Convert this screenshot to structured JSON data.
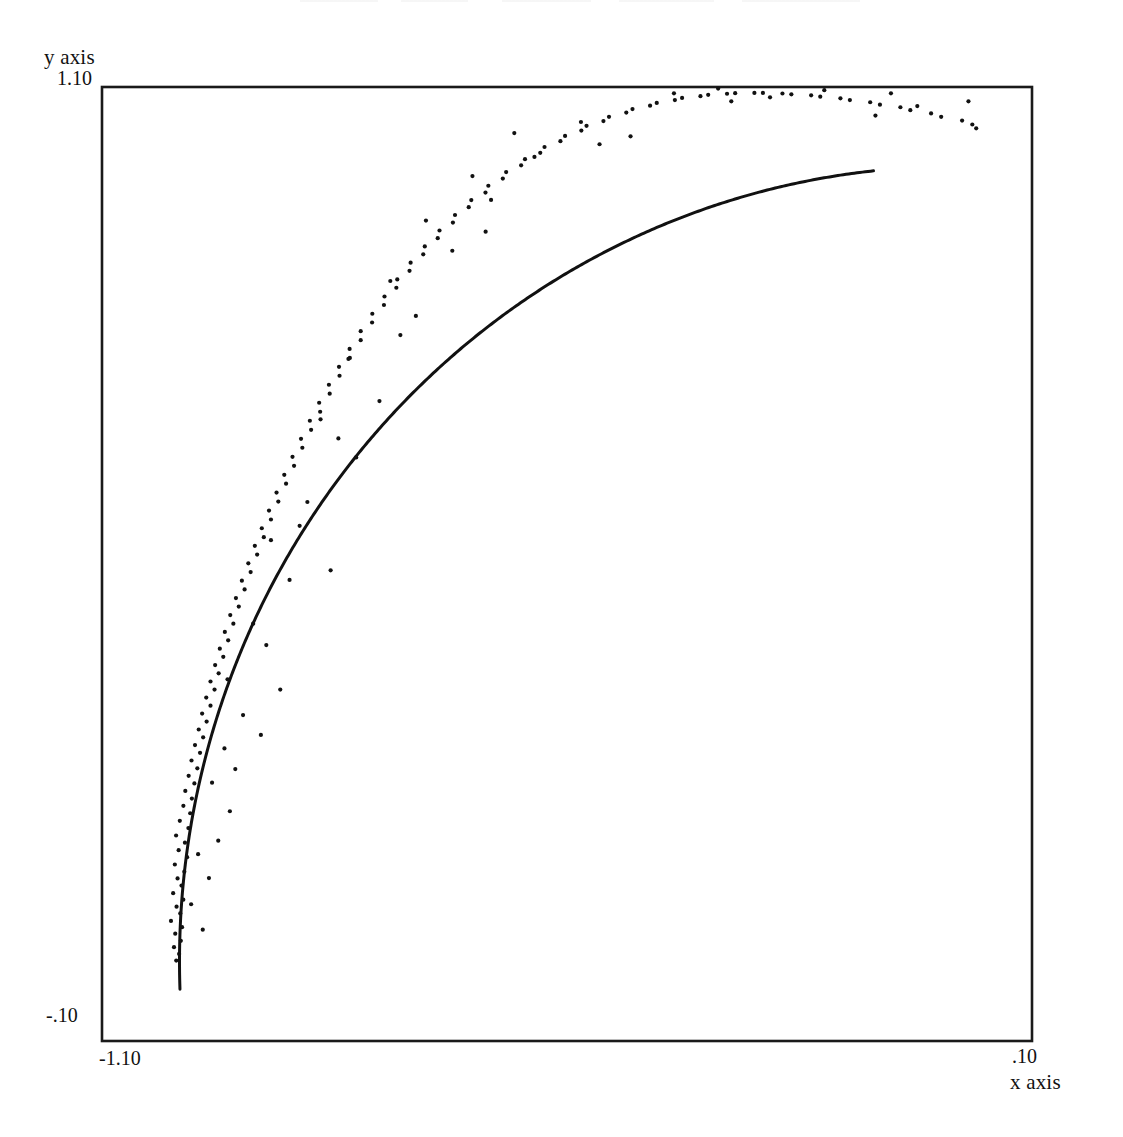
{
  "figure": {
    "background_color": "#ffffff",
    "ink_color": "#111111",
    "width": 1123,
    "height": 1137
  },
  "axes": {
    "y_axis_name": "y axis",
    "x_axis_name": "x axis",
    "y_tick_max": "1.10",
    "y_tick_min": "-.10",
    "x_tick_min": "-1.10",
    "x_tick_max": ".10",
    "frame": {
      "left": 102,
      "top": 87,
      "right": 1032,
      "bottom": 1041
    }
  },
  "chart_data": {
    "type": "scatter",
    "title": "",
    "xlabel": "x axis",
    "ylabel": "y axis",
    "xlim": [
      -1.1,
      0.1
    ],
    "ylim": [
      -0.1,
      1.1
    ],
    "xticks": [
      -1.1,
      0.1
    ],
    "xticklabels": [
      "-1.10",
      ".10"
    ],
    "yticks": [
      -0.1,
      1.1
    ],
    "yticklabels": [
      "-.10",
      "1.10"
    ],
    "grid": false,
    "legend": null,
    "series": [
      {
        "name": "fitted arc",
        "type": "line",
        "description": "unit circle arc, centre (0,0), radius 1.0, second quadrant from (-1,0) to (0,1)",
        "circle_center": [
          0.0,
          0.0
        ],
        "circle_radius": 1.0,
        "theta_deg_range": [
          96,
          182
        ],
        "color": "#111111",
        "linewidth": 3.0
      },
      {
        "name": "observations",
        "type": "scatter",
        "marker": "point",
        "marker_size": 3,
        "color": "#111111",
        "description": "noisy samples scattered about the unit circle arc",
        "points": [
          [
            -1.0042,
            0.0012
          ],
          [
            -1.0005,
            0.0095
          ],
          [
            -1.0071,
            0.018
          ],
          [
            -0.9983,
            0.026
          ],
          [
            -1.0055,
            0.035
          ],
          [
            -0.9967,
            0.0432
          ],
          [
            -1.011,
            0.051
          ],
          [
            -0.999,
            0.0605
          ],
          [
            -1.0038,
            0.069
          ],
          [
            -0.9951,
            0.0778
          ],
          [
            -1.0082,
            0.086
          ],
          [
            -0.9974,
            0.0955
          ],
          [
            -1.0025,
            0.1045
          ],
          [
            -0.9938,
            0.113
          ],
          [
            -1.006,
            0.122
          ],
          [
            -0.9902,
            0.1312
          ],
          [
            -1.0011,
            0.14
          ],
          [
            -0.993,
            0.1495
          ],
          [
            -1.0044,
            0.1585
          ],
          [
            -0.9885,
            0.1678
          ],
          [
            -0.9996,
            0.177
          ],
          [
            -0.9862,
            0.1865
          ],
          [
            -0.995,
            0.1958
          ],
          [
            -0.984,
            0.205
          ],
          [
            -0.9925,
            0.2145
          ],
          [
            -0.9808,
            0.224
          ],
          [
            -0.9882,
            0.2335
          ],
          [
            -0.977,
            0.243
          ],
          [
            -0.9845,
            0.2528
          ],
          [
            -0.9735,
            0.2625
          ],
          [
            -0.98,
            0.2722
          ],
          [
            -0.9695,
            0.282
          ],
          [
            -0.9752,
            0.2918
          ],
          [
            -0.965,
            0.3018
          ],
          [
            -0.9708,
            0.3118
          ],
          [
            -0.96,
            0.3218
          ],
          [
            -0.9655,
            0.332
          ],
          [
            -0.9548,
            0.342
          ],
          [
            -0.96,
            0.3522
          ],
          [
            -0.9495,
            0.3625
          ],
          [
            -0.954,
            0.3728
          ],
          [
            -0.9435,
            0.3832
          ],
          [
            -0.948,
            0.3935
          ],
          [
            -0.9372,
            0.404
          ],
          [
            -0.9415,
            0.4145
          ],
          [
            -0.9305,
            0.425
          ],
          [
            -0.9345,
            0.4358
          ],
          [
            -0.9235,
            0.4465
          ],
          [
            -0.9272,
            0.4572
          ],
          [
            -0.916,
            0.468
          ],
          [
            -0.9195,
            0.479
          ],
          [
            -0.9082,
            0.4898
          ],
          [
            -0.9112,
            0.5008
          ],
          [
            -0.8998,
            0.5118
          ],
          [
            -0.9028,
            0.5228
          ],
          [
            -0.8912,
            0.5338
          ],
          [
            -0.8938,
            0.545
          ],
          [
            -0.882,
            0.556
          ],
          [
            -0.8845,
            0.5672
          ],
          [
            -0.8725,
            0.5785
          ],
          [
            -0.8748,
            0.5898
          ],
          [
            -0.8625,
            0.601
          ],
          [
            -0.8648,
            0.6122
          ],
          [
            -0.8522,
            0.6235
          ],
          [
            -0.8542,
            0.6348
          ],
          [
            -0.8415,
            0.6462
          ],
          [
            -0.8432,
            0.6575
          ],
          [
            -0.8302,
            0.6688
          ],
          [
            -0.8318,
            0.6802
          ],
          [
            -0.8185,
            0.6915
          ],
          [
            -0.8198,
            0.7028
          ],
          [
            -0.8062,
            0.7142
          ],
          [
            -0.8072,
            0.7255
          ],
          [
            -0.7935,
            0.7368
          ],
          [
            -0.7942,
            0.748
          ],
          [
            -0.7802,
            0.7592
          ],
          [
            -0.7805,
            0.7705
          ],
          [
            -0.7662,
            0.7815
          ],
          [
            -0.7662,
            0.7928
          ],
          [
            -0.7515,
            0.8038
          ],
          [
            -0.7512,
            0.8148
          ],
          [
            -0.7362,
            0.8258
          ],
          [
            -0.7355,
            0.8365
          ],
          [
            -0.7202,
            0.8475
          ],
          [
            -0.719,
            0.858
          ],
          [
            -0.7032,
            0.8688
          ],
          [
            -0.7018,
            0.879
          ],
          [
            -0.6855,
            0.8895
          ],
          [
            -0.6835,
            0.8995
          ],
          [
            -0.6668,
            0.9098
          ],
          [
            -0.6645,
            0.9195
          ],
          [
            -0.6472,
            0.9295
          ],
          [
            -0.6445,
            0.939
          ],
          [
            -0.6268,
            0.9488
          ],
          [
            -0.6235,
            0.9578
          ],
          [
            -0.6052,
            0.9672
          ],
          [
            -0.6015,
            0.9758
          ],
          [
            -0.5828,
            0.9848
          ],
          [
            -0.5785,
            0.993
          ],
          [
            -0.5592,
            1.0015
          ],
          [
            -0.5542,
            1.0092
          ],
          [
            -0.5345,
            1.0172
          ],
          [
            -0.529,
            1.0245
          ],
          [
            -0.5085,
            1.0318
          ],
          [
            -0.5025,
            1.0385
          ],
          [
            -0.4815,
            1.0452
          ],
          [
            -0.4748,
            1.0512
          ],
          [
            -0.453,
            1.0572
          ],
          [
            -0.4458,
            1.0625
          ],
          [
            -0.4235,
            1.0678
          ],
          [
            -0.4155,
            1.0722
          ],
          [
            -0.3928,
            1.0765
          ],
          [
            -0.3842,
            1.08
          ],
          [
            -0.3608,
            1.0835
          ],
          [
            -0.3515,
            1.0862
          ],
          [
            -0.3278,
            1.0885
          ],
          [
            -0.3178,
            1.0902
          ],
          [
            -0.2935,
            1.0915
          ],
          [
            -0.283,
            1.0922
          ],
          [
            -0.2582,
            1.0925
          ],
          [
            -0.2472,
            1.0925
          ],
          [
            -0.222,
            1.0918
          ],
          [
            -0.2105,
            1.0908
          ],
          [
            -0.185,
            1.0895
          ],
          [
            -0.1732,
            1.0878
          ],
          [
            -0.1472,
            1.0858
          ],
          [
            -0.135,
            1.0835
          ],
          [
            -0.1088,
            1.0808
          ],
          [
            -0.0962,
            1.0778
          ],
          [
            -0.0698,
            1.0745
          ],
          [
            -0.057,
            1.0708
          ],
          [
            -0.0302,
            1.0668
          ],
          [
            -0.0172,
            1.0625
          ],
          [
            0.0098,
            1.0578
          ],
          [
            0.023,
            1.0528
          ],
          [
            -0.97,
            0.04
          ],
          [
            -0.962,
            0.105
          ],
          [
            -0.95,
            0.152
          ],
          [
            -0.935,
            0.189
          ],
          [
            -0.958,
            0.225
          ],
          [
            -0.942,
            0.268
          ],
          [
            -0.918,
            0.31
          ],
          [
            -0.938,
            0.355
          ],
          [
            -0.895,
            0.285
          ],
          [
            -0.87,
            0.342
          ],
          [
            -0.905,
            0.425
          ],
          [
            -0.858,
            0.48
          ],
          [
            -0.882,
            0.53
          ],
          [
            -0.835,
            0.578
          ],
          [
            -0.805,
            0.492
          ],
          [
            -0.772,
            0.634
          ],
          [
            -0.818,
            0.682
          ],
          [
            -0.742,
            0.705
          ],
          [
            -0.782,
            0.758
          ],
          [
            -0.695,
            0.812
          ],
          [
            -0.728,
            0.856
          ],
          [
            -0.648,
            0.894
          ],
          [
            -0.682,
            0.932
          ],
          [
            -0.598,
            0.958
          ],
          [
            -0.622,
            0.988
          ],
          [
            -0.542,
            1.012
          ],
          [
            -0.568,
            1.042
          ],
          [
            -0.482,
            1.056
          ],
          [
            -0.418,
            1.038
          ],
          [
            -0.362,
            1.092
          ],
          [
            -0.305,
            1.098
          ],
          [
            -0.238,
            1.087
          ],
          [
            -0.168,
            1.096
          ],
          [
            -0.102,
            1.064
          ],
          [
            -0.048,
            1.076
          ],
          [
            0.028,
            1.048
          ],
          [
            -0.985,
            0.072
          ],
          [
            -0.976,
            0.135
          ],
          [
            -0.928,
            0.242
          ],
          [
            -0.888,
            0.398
          ],
          [
            -0.845,
            0.548
          ],
          [
            -0.795,
            0.658
          ],
          [
            -0.715,
            0.788
          ],
          [
            -0.605,
            0.918
          ],
          [
            -0.458,
            1.028
          ],
          [
            -0.288,
            1.082
          ],
          [
            -0.082,
            1.092
          ],
          [
            0.018,
            1.082
          ]
        ]
      }
    ]
  }
}
